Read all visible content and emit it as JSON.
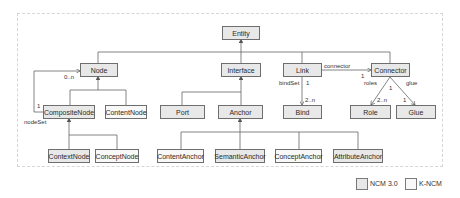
{
  "diagram": {
    "classes": {
      "entity": "Entity",
      "node": "Node",
      "interface": "Interface",
      "link": "Link",
      "connector": "Connector",
      "composite_node": "CompositeNode",
      "content_node": "ContentNode",
      "port": "Port",
      "anchor": "Anchor",
      "bind": "Bind",
      "role": "Role",
      "glue": "Glue",
      "context_node": "ContextNode",
      "concept_node": "ConceptNode",
      "content_anchor": "ContentAnchor",
      "semantic_anchor": "SemanticAnchor",
      "concept_anchor": "ConceptAnchor",
      "attribute_anchor": "AttributeAnchor"
    },
    "labels": {
      "node_multiplicity": "0..n",
      "nodeset_multiplicity": "1",
      "nodeset": "nodeSet",
      "connector_assoc": "connector",
      "connector_multiplicity": "1",
      "bindset": "bindSet",
      "bindset_one": "1",
      "bind_multiplicity": "2..n",
      "roles": "roles",
      "glue": "glue",
      "connector_one": "1",
      "role_multiplicity": "2..n",
      "glue_multiplicity": "1"
    }
  },
  "legend": {
    "ncm30": "NCM 3.0",
    "kncm": "K-NCM"
  },
  "colors": {
    "ncm_fill": "#e8e8e8",
    "kncm_fill": "#f8f8f8",
    "stroke": "#6e6e6e"
  }
}
